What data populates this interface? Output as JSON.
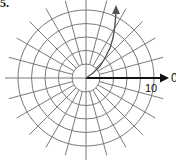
{
  "problem": {
    "label": "5."
  },
  "polar_grid": {
    "center": {
      "x": 86,
      "y": 78
    },
    "circle_radii_px": [
      14,
      27.5,
      41,
      54.5,
      68
    ],
    "radial_line_inner_px": 14,
    "radial_line_outer_px": 80,
    "radial_step_deg": 15,
    "grid_color": "#7a7a7a",
    "axis_color": "#111111"
  },
  "polar_axis": {
    "angle_label": "0",
    "tick_label": "10",
    "tick_value": 10
  },
  "curve": {
    "description": "spiral-like curve starting at pole, sweeping counterclockwise up with arrowhead",
    "color": "#555555",
    "points": [
      [
        86,
        78
      ],
      [
        93,
        73
      ],
      [
        100,
        66
      ],
      [
        105,
        58
      ],
      [
        110,
        48
      ],
      [
        113,
        38
      ],
      [
        115,
        25
      ],
      [
        116,
        12
      ]
    ]
  }
}
